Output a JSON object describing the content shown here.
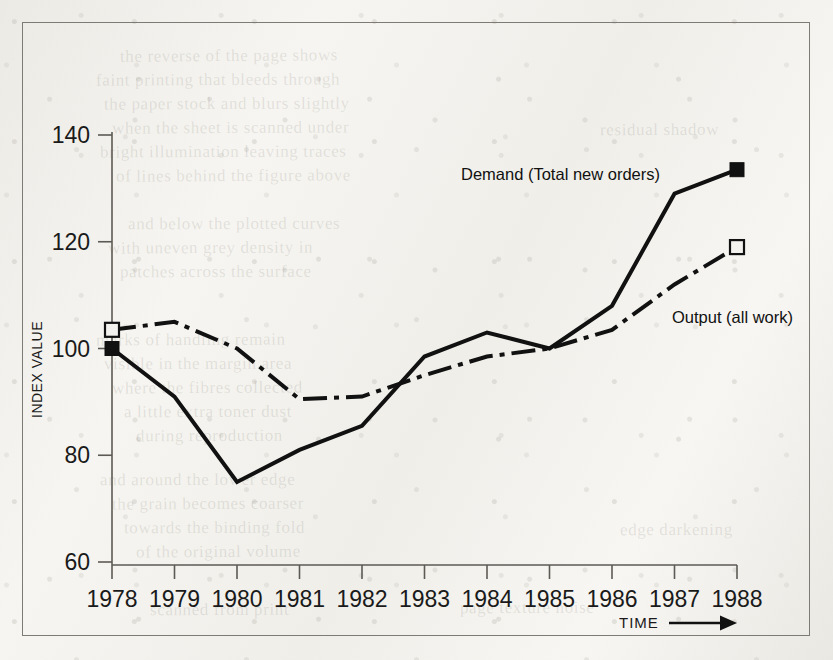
{
  "figure": {
    "background_color": "#f3f2ee",
    "ink_color": "#111111",
    "frame_color": "#7e7b74"
  },
  "axes": {
    "y_title": "INDEX VALUE",
    "x_title": "TIME",
    "x_arrow_icon": "right-arrow-icon",
    "y_ticks": [
      "60",
      "80",
      "100",
      "120",
      "140"
    ],
    "x_ticks": [
      "1978",
      "1979",
      "1980",
      "1981",
      "1982",
      "1983",
      "1984",
      "1985",
      "1986",
      "1987",
      "1988"
    ]
  },
  "annotations": {
    "demand_label": "Demand (Total new orders)",
    "output_label": "Output  (all work)"
  },
  "ghost_text": [
    {
      "text": "the reverse of the page shows",
      "x": 120,
      "y": 46,
      "size": 17,
      "rot": -0.4
    },
    {
      "text": "faint printing that bleeds through",
      "x": 96,
      "y": 70,
      "size": 17,
      "rot": -0.3
    },
    {
      "text": "the paper stock and blurs slightly",
      "x": 104,
      "y": 94,
      "size": 17,
      "rot": -0.2
    },
    {
      "text": "when the sheet is scanned under",
      "x": 112,
      "y": 118,
      "size": 17,
      "rot": -0.3
    },
    {
      "text": "bright illumination leaving traces",
      "x": 100,
      "y": 142,
      "size": 17,
      "rot": -0.2
    },
    {
      "text": "of lines behind the figure above",
      "x": 116,
      "y": 166,
      "size": 17,
      "rot": -0.3
    },
    {
      "text": "and below the plotted curves",
      "x": 128,
      "y": 214,
      "size": 17,
      "rot": -0.2
    },
    {
      "text": "with uneven grey density in",
      "x": 108,
      "y": 238,
      "size": 17,
      "rot": -0.3
    },
    {
      "text": "patches across the surface",
      "x": 120,
      "y": 262,
      "size": 17,
      "rot": -0.2
    },
    {
      "text": "marks of handling remain",
      "x": 96,
      "y": 330,
      "size": 17,
      "rot": -0.3
    },
    {
      "text": "visible in the margin area",
      "x": 104,
      "y": 354,
      "size": 17,
      "rot": -0.2
    },
    {
      "text": "where the fibres collected",
      "x": 112,
      "y": 378,
      "size": 17,
      "rot": -0.3
    },
    {
      "text": "a little extra toner dust",
      "x": 124,
      "y": 402,
      "size": 17,
      "rot": -0.2
    },
    {
      "text": "during reproduction",
      "x": 136,
      "y": 426,
      "size": 17,
      "rot": -0.3
    },
    {
      "text": "and around the lower edge",
      "x": 100,
      "y": 470,
      "size": 17,
      "rot": -0.2
    },
    {
      "text": "the grain becomes coarser",
      "x": 112,
      "y": 494,
      "size": 17,
      "rot": -0.3
    },
    {
      "text": "towards the binding fold",
      "x": 124,
      "y": 518,
      "size": 17,
      "rot": -0.2
    },
    {
      "text": "of the original volume",
      "x": 136,
      "y": 542,
      "size": 17,
      "rot": -0.3
    },
    {
      "text": "scanned from print",
      "x": 150,
      "y": 600,
      "size": 17,
      "rot": -0.2
    },
    {
      "text": "page texture noise",
      "x": 460,
      "y": 598,
      "size": 17,
      "rot": -0.2
    },
    {
      "text": "residual shadow",
      "x": 600,
      "y": 120,
      "size": 17,
      "rot": -0.3
    },
    {
      "text": "edge darkening",
      "x": 620,
      "y": 520,
      "size": 17,
      "rot": -0.2
    }
  ],
  "chart_data": {
    "type": "line",
    "title": "",
    "xlabel": "TIME",
    "ylabel": "INDEX VALUE",
    "x": [
      1978,
      1979,
      1980,
      1981,
      1982,
      1983,
      1984,
      1985,
      1986,
      1987,
      1988
    ],
    "xlim": [
      1978,
      1988
    ],
    "ylim": [
      60,
      140
    ],
    "ytick_step": 20,
    "grid": false,
    "legend_position": "inline-annotation",
    "series": [
      {
        "name": "Demand (Total new orders)",
        "line_style": "solid",
        "line_width": 4,
        "color": "#111111",
        "marker": "filled-square",
        "marker_at": [
          "first",
          "last"
        ],
        "values": [
          100,
          91,
          75,
          81,
          85.5,
          98.5,
          103,
          100,
          108,
          129,
          133.5
        ]
      },
      {
        "name": "Output  (all work)",
        "line_style": "dash-dot",
        "line_width": 4,
        "color": "#111111",
        "marker": "open-square",
        "marker_at": [
          "first",
          "last"
        ],
        "values": [
          103.5,
          105,
          100,
          90.5,
          91,
          95,
          98.5,
          100,
          103.5,
          112,
          119
        ]
      }
    ]
  }
}
